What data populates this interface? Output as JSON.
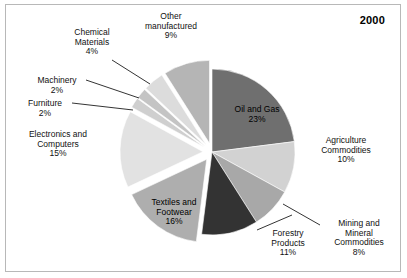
{
  "title": "2000",
  "frame": {
    "border_color": "#b8b8b8",
    "background": "#ffffff"
  },
  "chart_data": {
    "type": "pie",
    "title": "2000",
    "units": "percent",
    "total": 100,
    "start_angle_deg": 0,
    "direction": "clockwise",
    "legend": "none",
    "labels_position": "outside-and-inside-with-leader-lines",
    "categories": [
      "Oil and Gas",
      "Agriculture Commodities",
      "Mining and Mineral Commodities",
      "Forestry Products",
      "Textiles and Footwear",
      "Electronics and Computers",
      "Furniture",
      "Machinery",
      "Chemical Materials",
      "Other manufactured"
    ],
    "values": [
      23,
      10,
      8,
      11,
      16,
      15,
      2,
      2,
      4,
      9
    ],
    "colors": [
      "#6f6f6f",
      "#d2d2d2",
      "#a8a8a8",
      "#333333",
      "#aeaeae",
      "#e2e2e2",
      "#cfcfcf",
      "#c4c4c4",
      "#dcdcdc",
      "#b5b5b5"
    ],
    "exploded": [
      false,
      false,
      false,
      false,
      true,
      true,
      true,
      true,
      true,
      true
    ],
    "slices": [
      {
        "label": "Oil and Gas",
        "value": 23,
        "value_text": "23%",
        "color": "#6f6f6f",
        "exploded": false,
        "label_placement": "inside"
      },
      {
        "label": "Agriculture Commodities",
        "value": 10,
        "value_text": "10%",
        "color": "#d2d2d2",
        "exploded": false,
        "label_placement": "outside"
      },
      {
        "label": "Mining and Mineral Commodities",
        "value": 8,
        "value_text": "8%",
        "color": "#a8a8a8",
        "exploded": false,
        "label_placement": "outside-leader"
      },
      {
        "label": "Forestry Products",
        "value": 11,
        "value_text": "11%",
        "color": "#333333",
        "exploded": false,
        "label_placement": "outside-leader"
      },
      {
        "label": "Textiles and Footwear",
        "value": 16,
        "value_text": "16%",
        "color": "#aeaeae",
        "exploded": true,
        "label_placement": "inside"
      },
      {
        "label": "Electronics and Computers",
        "value": 15,
        "value_text": "15%",
        "color": "#e2e2e2",
        "exploded": true,
        "label_placement": "outside"
      },
      {
        "label": "Furniture",
        "value": 2,
        "value_text": "2%",
        "color": "#cfcfcf",
        "exploded": true,
        "label_placement": "outside-leader"
      },
      {
        "label": "Machinery",
        "value": 2,
        "value_text": "2%",
        "color": "#c4c4c4",
        "exploded": true,
        "label_placement": "outside-leader"
      },
      {
        "label": "Chemical Materials",
        "value": 4,
        "value_text": "4%",
        "color": "#dcdcdc",
        "exploded": true,
        "label_placement": "outside-leader"
      },
      {
        "label": "Other manufactured",
        "value": 9,
        "value_text": "9%",
        "color": "#b5b5b5",
        "exploded": true,
        "label_placement": "outside"
      }
    ]
  },
  "labels": {
    "oil_and_gas": {
      "line1": "Oil and Gas",
      "line2": "23%"
    },
    "agriculture": {
      "line1": "Agriculture",
      "line2": "Commodities",
      "line3": "10%"
    },
    "mining": {
      "line1": "Mining and",
      "line2": "Mineral",
      "line3": "Commodities",
      "line4": "8%"
    },
    "forestry": {
      "line1": "Forestry",
      "line2": "Products",
      "line3": "11%"
    },
    "textiles": {
      "line1": "Textiles and",
      "line2": "Footwear",
      "line3": "16%"
    },
    "electronics": {
      "line1": "Electronics and",
      "line2": "Computers",
      "line3": "15%"
    },
    "furniture": {
      "line1": "Furniture",
      "line2": "2%"
    },
    "machinery": {
      "line1": "Machinery",
      "line2": "2%"
    },
    "chemical": {
      "line1": "Chemical",
      "line2": "Materials",
      "line3": "4%"
    },
    "other_manufactured": {
      "line1": "Other",
      "line2": "manufactured",
      "line3": "9%"
    }
  }
}
